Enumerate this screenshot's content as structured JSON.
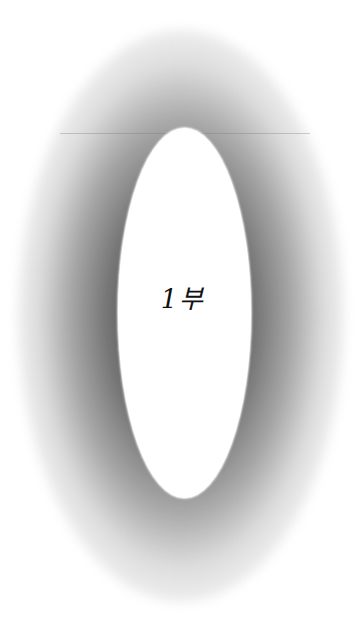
{
  "page": {
    "title_text": "1부",
    "background_color": "#ffffff",
    "vignette_color": "#555555",
    "text_color": "#111111"
  }
}
